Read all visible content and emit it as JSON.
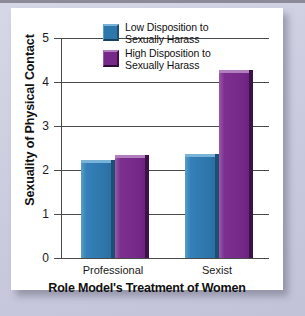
{
  "chart_data": {
    "type": "bar",
    "title": "",
    "xlabel": "Role Model's Treatment of Women",
    "ylabel": "Sexuality of Physical Contact",
    "categories": [
      "Professional",
      "Sexist"
    ],
    "series": [
      {
        "name": "Low Disposition to\nSexually Harass",
        "color": "#2e77ad",
        "values": [
          2.15,
          2.3
        ]
      },
      {
        "name": "High Disposition to\nSexually Harass",
        "color": "#77298a",
        "values": [
          2.27,
          4.2
        ]
      }
    ],
    "ylim": [
      0,
      5
    ],
    "yticks": [
      "0",
      "1",
      "2",
      "3",
      "4",
      "5"
    ],
    "grid": true,
    "legend_position": "top-center"
  },
  "legend": {
    "items": [
      {
        "label": "Low Disposition to\nSexually Harass",
        "swatch": "blue-swatch"
      },
      {
        "label": "High Disposition to\nSexually Harass",
        "swatch": "purple-swatch"
      }
    ]
  },
  "axes": {
    "y_title": "Sexuality of Physical Contact",
    "x_title": "Role Model's Treatment of Women",
    "y_ticks": [
      "5",
      "4",
      "3",
      "2",
      "1",
      "0"
    ],
    "x_categories": [
      "Professional",
      "Sexist"
    ]
  }
}
